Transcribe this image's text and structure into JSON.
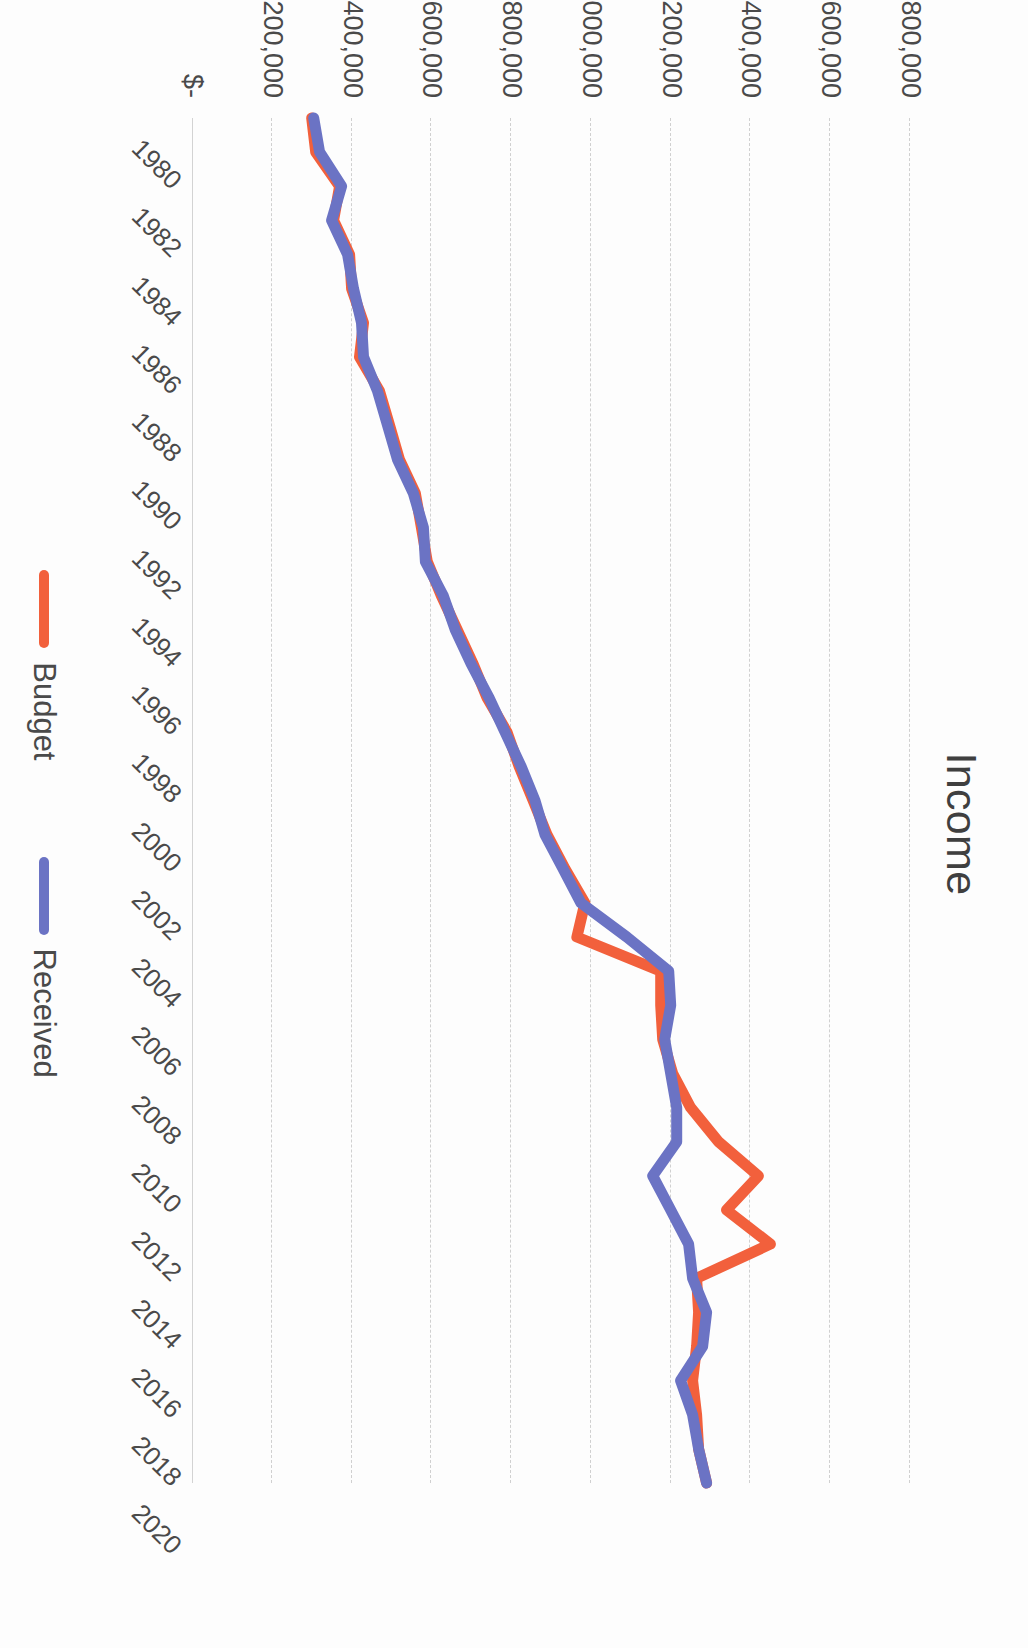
{
  "chart": {
    "title": "Income"
  },
  "legend": {
    "items": [
      {
        "label": "Budget",
        "color": "#F2603C",
        "icon": "line-swatch-icon"
      },
      {
        "label": "Received",
        "color": "#6B73C4",
        "icon": "line-swatch-icon"
      }
    ]
  },
  "axes": {
    "y_ticks": [
      "$1,800,000",
      "$1,600,000",
      "$1,400,000",
      "$1,200,000",
      "$1,000,000",
      "$800,000",
      "$600,000",
      "$400,000",
      "$200,000",
      "$-"
    ],
    "x_ticks": [
      "1980",
      "1982",
      "1984",
      "1986",
      "1988",
      "1990",
      "1992",
      "1994",
      "1996",
      "1998",
      "2000",
      "2002",
      "2004",
      "2006",
      "2008",
      "2010",
      "2012",
      "2014",
      "2016",
      "2018",
      "2020"
    ]
  },
  "chart_data": {
    "type": "line",
    "title": "Income",
    "xlabel": "",
    "ylabel": "",
    "grid": true,
    "legend_position": "bottom",
    "ylim": [
      0,
      1800000
    ],
    "ytick_interval": 200000,
    "xlim": [
      "1980",
      "2020"
    ],
    "categories": [
      "1980",
      "1981",
      "1982",
      "1983",
      "1984",
      "1985",
      "1986",
      "1987",
      "1988",
      "1989",
      "1990",
      "1991",
      "1992",
      "1993",
      "1994",
      "1995",
      "1996",
      "1997",
      "1998",
      "1999",
      "2000",
      "2001",
      "2002",
      "2003",
      "2004",
      "2005",
      "2006",
      "2007",
      "2008",
      "2009",
      "2010",
      "2011",
      "2012",
      "2013",
      "2014",
      "2015",
      "2016",
      "2017",
      "2018",
      "2019",
      "2020"
    ],
    "series": [
      {
        "name": "Budget",
        "color": "#F2603C",
        "values": [
          300000,
          310000,
          370000,
          355000,
          395000,
          400000,
          430000,
          420000,
          470000,
          495000,
          520000,
          560000,
          575000,
          590000,
          625000,
          665000,
          705000,
          740000,
          790000,
          820000,
          855000,
          890000,
          935000,
          985000,
          965000,
          1175000,
          1175000,
          1180000,
          1205000,
          1250000,
          1320000,
          1420000,
          1340000,
          1450000,
          1265000,
          1270000,
          1265000,
          1255000,
          1265000,
          1270000,
          1290000
        ]
      },
      {
        "name": "Received",
        "color": "#6B73C4",
        "values": [
          305000,
          320000,
          375000,
          350000,
          390000,
          405000,
          425000,
          430000,
          465000,
          490000,
          515000,
          555000,
          580000,
          585000,
          630000,
          660000,
          700000,
          745000,
          785000,
          825000,
          860000,
          885000,
          930000,
          975000,
          1090000,
          1195000,
          1200000,
          1185000,
          1200000,
          1215000,
          1215000,
          1155000,
          1200000,
          1245000,
          1255000,
          1290000,
          1280000,
          1225000,
          1255000,
          1270000,
          1290000
        ]
      }
    ]
  }
}
